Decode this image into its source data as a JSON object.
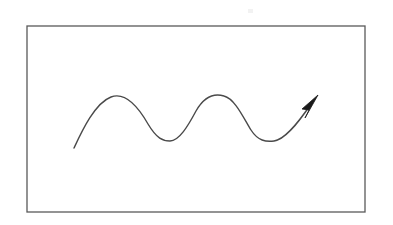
{
  "document": {
    "title": "Wave Arrow Diagram",
    "type": "line-diagram",
    "background_color": "#ffffff",
    "width": 393,
    "height": 225
  },
  "frame": {
    "name": "rectangular border",
    "stroke_color": "#595959",
    "stroke_width": 1.3,
    "fill": "none",
    "x": 27,
    "y": 26,
    "width": 338,
    "height": 186
  },
  "wave": {
    "name": "sinusoidal arrow curve",
    "stroke_color": "#4a4a4a",
    "stroke_width": 1.4,
    "fill": "none",
    "cycles": 2,
    "amplitude": 22.5,
    "path": "M 74 148 C 82 131 95 103 111 97 C 127 91 140 110 148 124 C 157 139 163 141 170 141 C 179 141 188 126 196 111 C 204 97 214 93 224 96 C 235 99 243 117 251 130 C 258 141 266 142 274 141 C 284 140 296 126 311 104",
    "start_point": [
      74,
      148
    ],
    "key_points": [
      {
        "label": "start",
        "x": 74,
        "y": 148
      },
      {
        "label": "peak-1",
        "x": 119,
        "y": 96
      },
      {
        "label": "trough-1",
        "x": 170,
        "y": 141
      },
      {
        "label": "peak-2",
        "x": 225,
        "y": 96
      },
      {
        "label": "trough-2",
        "x": 274,
        "y": 141
      },
      {
        "label": "tip",
        "x": 318,
        "y": 96
      }
    ]
  },
  "arrowhead": {
    "name": "arrow head",
    "fill_color": "#1a1a1a",
    "tip": [
      318,
      96
    ],
    "direction_degrees": -48,
    "points": "318,95 302,109 309,110 305,118"
  },
  "artifact": {
    "name": "faint scan speck",
    "color": "#f2f2f2",
    "x": 248,
    "y": 9,
    "width": 5,
    "height": 4
  },
  "chart_data": {
    "type": "line",
    "title": "Wave Arrow Diagram",
    "xlabel": "",
    "ylabel": "",
    "grid": false,
    "legend": "none",
    "annotations": [
      "arrowhead at right end pointing up-right"
    ],
    "series": [
      {
        "name": "sine wave",
        "x": [
          74,
          96,
          119,
          145,
          170,
          198,
          225,
          250,
          274,
          296,
          318
        ],
        "y": [
          148,
          113,
          96,
          125,
          141,
          110,
          96,
          129,
          141,
          122,
          96
        ]
      }
    ]
  }
}
